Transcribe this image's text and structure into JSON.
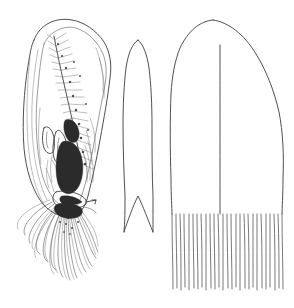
{
  "plate": {
    "title": "Comparative line drawing plate of three specimen structures",
    "background_color": "#ffffff",
    "ink_color": "#3c3c3c",
    "width_px": 294,
    "height_px": 308,
    "figure_count": 3
  },
  "figures": [
    {
      "id": "figure-left",
      "label": "",
      "name": "dissected-valve-with-internal-plume-and-tentacles",
      "description": "Elongate ovate shell or valve shown in interior view with double outline, dense feathery hatched plume running down the midline, dark shaded cavity in the lower third, and a dense tuft of fine curling filaments emerging from the basal opening",
      "bounds": {
        "x": 18,
        "y": 18,
        "width": 100,
        "height": 272
      },
      "features": [
        "outer-outline",
        "inner-outline",
        "plumose-hatching",
        "dark-cavity",
        "filament-tuft"
      ],
      "filament_count": 24,
      "shading": "stipple-and-hatch"
    },
    {
      "id": "figure-middle",
      "label": "",
      "name": "narrow-lanceolate-plate-with-basal-notch",
      "description": "Slender elongate lanceolate plate drawn in simple outline, pointed apex at top, parallel sides, and a deep V-shaped notch cut into the base producing two acute basal lobes",
      "bounds": {
        "x": 118,
        "y": 38,
        "width": 42,
        "height": 196
      },
      "features": [
        "apex-point",
        "left-margin",
        "right-margin",
        "basal-v-notch"
      ],
      "apex_y": 40,
      "notch_apex_y": 196,
      "base_y": 232
    },
    {
      "id": "figure-right",
      "label": "",
      "name": "broad-domed-plate-with-fringed-margin",
      "description": "Broad tongue-shaped plate with a rounded domed apex, a single vertical midrib line running from just below the apex to the fringe, straight lateral margins, and a wide distal border of about twenty-six closely spaced parallel bristle lines",
      "bounds": {
        "x": 168,
        "y": 18,
        "width": 118,
        "height": 272
      },
      "features": [
        "domed-apex",
        "midrib",
        "left-margin",
        "right-margin",
        "bristle-fringe"
      ],
      "apex_x": 213,
      "apex_y": 20,
      "midrib_top_y": 45,
      "fringe_start_y": 213,
      "fringe_end_y": 290,
      "fringe_line_count": 26
    }
  ],
  "annotations": {
    "caption": "",
    "scale_bar": "",
    "figure_numbers": []
  }
}
